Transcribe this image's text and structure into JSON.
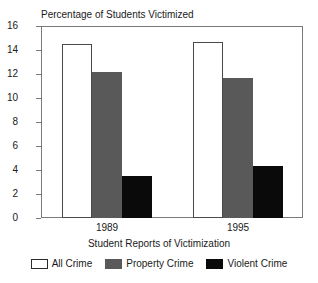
{
  "chart_data": {
    "type": "bar",
    "title": "Percentage of Students Victimized",
    "xlabel": "Student Reports of Victimization",
    "ylabel": "",
    "categories": [
      "1989",
      "1995"
    ],
    "series": [
      {
        "name": "All Crime",
        "color": "#ffffff",
        "values": [
          14.5,
          14.7
        ]
      },
      {
        "name": "Property Crime",
        "color": "#595959",
        "values": [
          12.2,
          11.7
        ]
      },
      {
        "name": "Violent Crime",
        "color": "#0a0a0a",
        "values": [
          3.5,
          4.35
        ]
      }
    ],
    "ylim": [
      0,
      16
    ],
    "yticks": [
      0,
      2,
      4,
      6,
      8,
      10,
      12,
      14,
      16
    ],
    "ytick_labels": [
      "0",
      "2",
      "4",
      "6",
      "8",
      "10",
      "12",
      "14",
      "16"
    ],
    "grid": false,
    "legend_position": "bottom"
  }
}
